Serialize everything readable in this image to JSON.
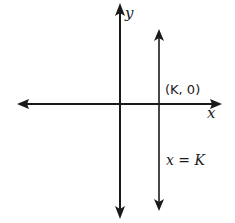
{
  "diagram": {
    "type": "coordinate-plane",
    "colors": {
      "line": "#1a1a1a",
      "background": "#ffffff"
    },
    "axes": {
      "x_label": "x",
      "y_label": "y"
    },
    "vertical_line": {
      "equation_label": "x = K",
      "intercept_label": "(K, 0)"
    }
  }
}
